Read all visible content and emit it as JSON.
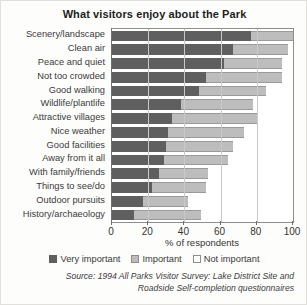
{
  "chart_data": {
    "type": "bar",
    "orientation": "horizontal",
    "stacked": true,
    "percent": true,
    "title": "What visitors enjoy about the Park",
    "xlabel": "% of respondents",
    "ylabel": "",
    "xlim": [
      0,
      100
    ],
    "xticks": [
      0,
      20,
      40,
      60,
      80,
      100
    ],
    "xtick_labels": [
      "0",
      "20",
      "40",
      "60",
      "80",
      "100"
    ],
    "grid": false,
    "legend_position": "bottom",
    "categories": [
      "Scenery/landscape",
      "Clean air",
      "Peace and quiet",
      "Not too crowded",
      "Good walking",
      "Wildlife/plantlife",
      "Attractive villages",
      "Nice weather",
      "Good facilities",
      "Away from it all",
      "With family/friends",
      "Things to see/do",
      "Outdoor pursuits",
      "History/archaeology"
    ],
    "series": [
      {
        "name": "Very important",
        "color": "#5f5f5f",
        "values": [
          77,
          67,
          62,
          52,
          48,
          38,
          33,
          31,
          30,
          29,
          26,
          22,
          17,
          12
        ]
      },
      {
        "name": "Important",
        "color": "#bdbdbd",
        "values": [
          23,
          30,
          32,
          42,
          37,
          40,
          47,
          42,
          37,
          35,
          27,
          30,
          25,
          37
        ]
      },
      {
        "name": "Not important",
        "color": "#ffffff",
        "values": [
          0,
          3,
          6,
          6,
          15,
          22,
          20,
          27,
          33,
          36,
          47,
          48,
          58,
          51
        ]
      }
    ],
    "source": {
      "line1": "Source: 1994 All Parks Visitor Survey: Lake District Site and",
      "line2": "Roadside Self-completion questionnaires"
    }
  }
}
